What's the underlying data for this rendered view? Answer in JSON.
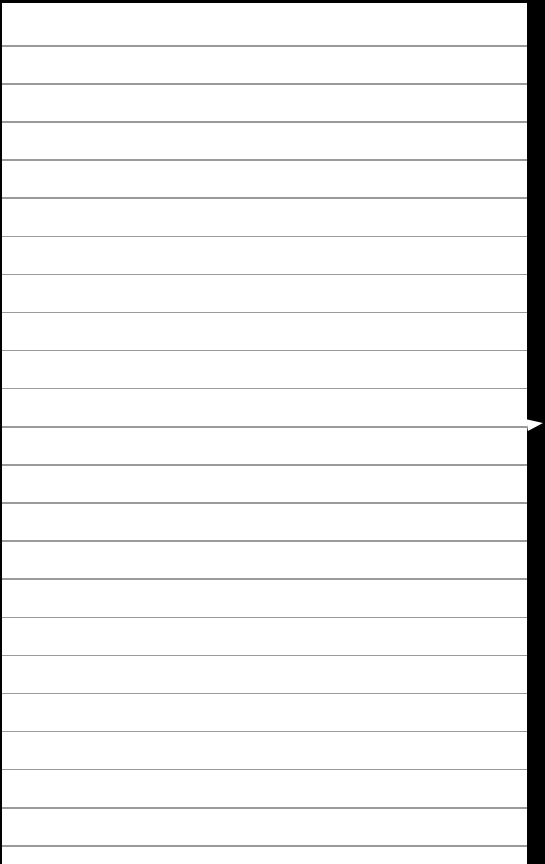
{
  "page": {
    "type": "lined-paper",
    "background_color": "#ffffff",
    "rule_color": "#9a9a9a",
    "border_color": "#000000",
    "first_rule_y": 42,
    "rule_spacing": 38.1,
    "rule_count": 22
  },
  "right_edge": {
    "marker_icon": "pointer-arrow"
  }
}
